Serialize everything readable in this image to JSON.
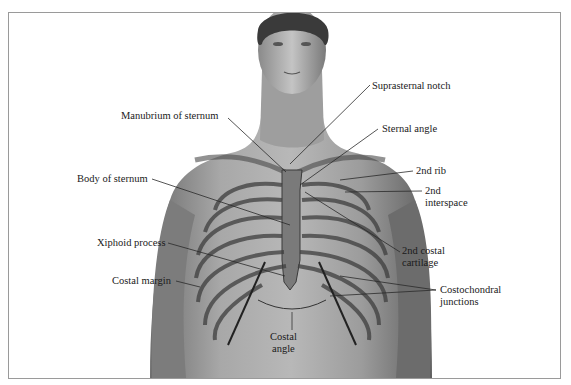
{
  "figure": {
    "labels": {
      "suprasternal_notch": "Suprasternal notch",
      "manubrium": "Manubrium of sternum",
      "sternal_angle": "Sternal angle",
      "second_rib": "2nd rib",
      "body_of_sternum": "Body of sternum",
      "second_interspace_line1": "2nd",
      "second_interspace_line2": "interspace",
      "xiphoid": "Xiphoid process",
      "second_costal_cartilage_line1": "2nd costal",
      "second_costal_cartilage_line2": "cartilage",
      "costal_margin": "Costal margin",
      "costochondral_line1": "Costochondral",
      "costochondral_line2": "junctions",
      "costal_angle_line1": "Costal",
      "costal_angle_line2": "angle"
    },
    "colors": {
      "skin_light": "#c8c8c8",
      "skin_mid": "#9a9a9a",
      "skin_dark": "#5a5a5a",
      "hair": "#3a3a3a",
      "leader_line": "#2a2a2a",
      "frame_border": "#9a9a9a"
    }
  }
}
